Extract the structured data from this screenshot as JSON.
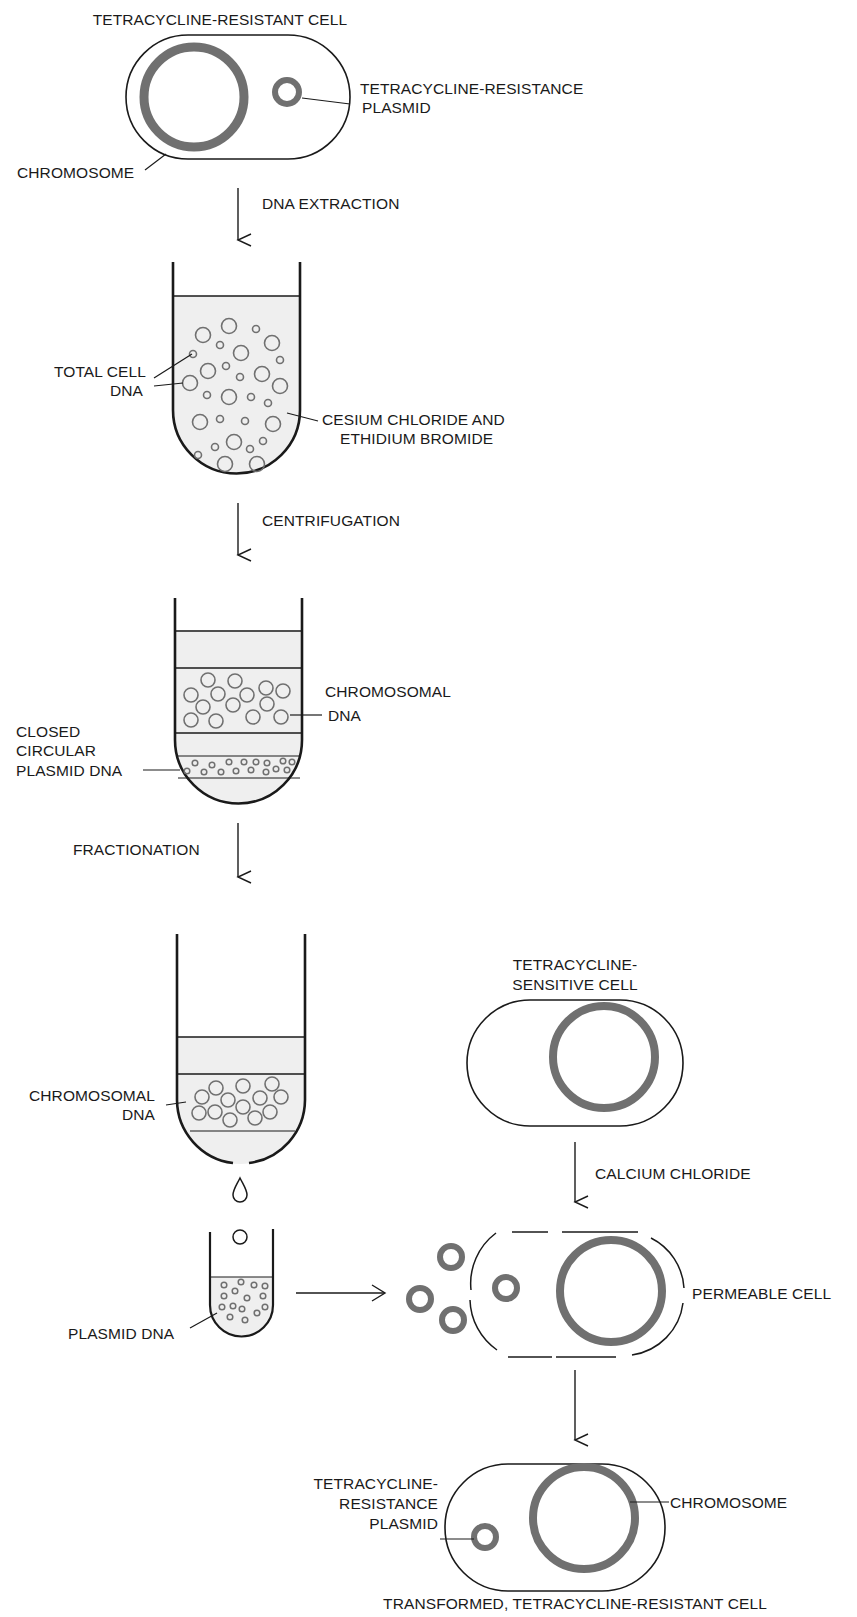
{
  "diagram": {
    "type": "flow",
    "colors": {
      "ink": "#1a1a1a",
      "dna_ring": "#707070",
      "fluid": "#efefef",
      "background": "#ffffff"
    },
    "stage1": {
      "title": "TETRACYCLINE-RESISTANT CELL",
      "plasmid_label_line1": "TETRACYCLINE-RESISTANCE",
      "plasmid_label_line2": "PLASMID",
      "chromosome_label": "CHROMOSOME"
    },
    "step1": {
      "label": "DNA EXTRACTION"
    },
    "tube1": {
      "dna_label_line1": "TOTAL CELL",
      "dna_label_line2": "DNA",
      "medium_label_line1": "CESIUM CHLORIDE AND",
      "medium_label_line2": "ETHIDIUM BROMIDE"
    },
    "step2": {
      "label": "CENTRIFUGATION"
    },
    "tube2": {
      "chromosomal_label_line1": "CHROMOSOMAL",
      "chromosomal_label_line2": "DNA",
      "plasmid_label_line1": "CLOSED",
      "plasmid_label_line2": "CIRCULAR",
      "plasmid_label_line3": "PLASMID DNA"
    },
    "step3": {
      "label": "FRACTIONATION"
    },
    "tube3": {
      "chromosomal_label_line1": "CHROMOSOMAL",
      "chromosomal_label_line2": "DNA"
    },
    "collect_tube": {
      "label": "PLASMID DNA"
    },
    "sensitive_cell": {
      "title_line1": "TETRACYCLINE-",
      "title_line2": "SENSITIVE CELL"
    },
    "step4": {
      "label": "CALCIUM CHLORIDE"
    },
    "permeable_cell": {
      "label": "PERMEABLE CELL"
    },
    "final_cell": {
      "plasmid_label_line1": "TETRACYCLINE-",
      "plasmid_label_line2": "RESISTANCE",
      "plasmid_label_line3": "PLASMID",
      "chromosome_label": "CHROMOSOME",
      "title": "TRANSFORMED, TETRACYCLINE-RESISTANT CELL"
    }
  }
}
